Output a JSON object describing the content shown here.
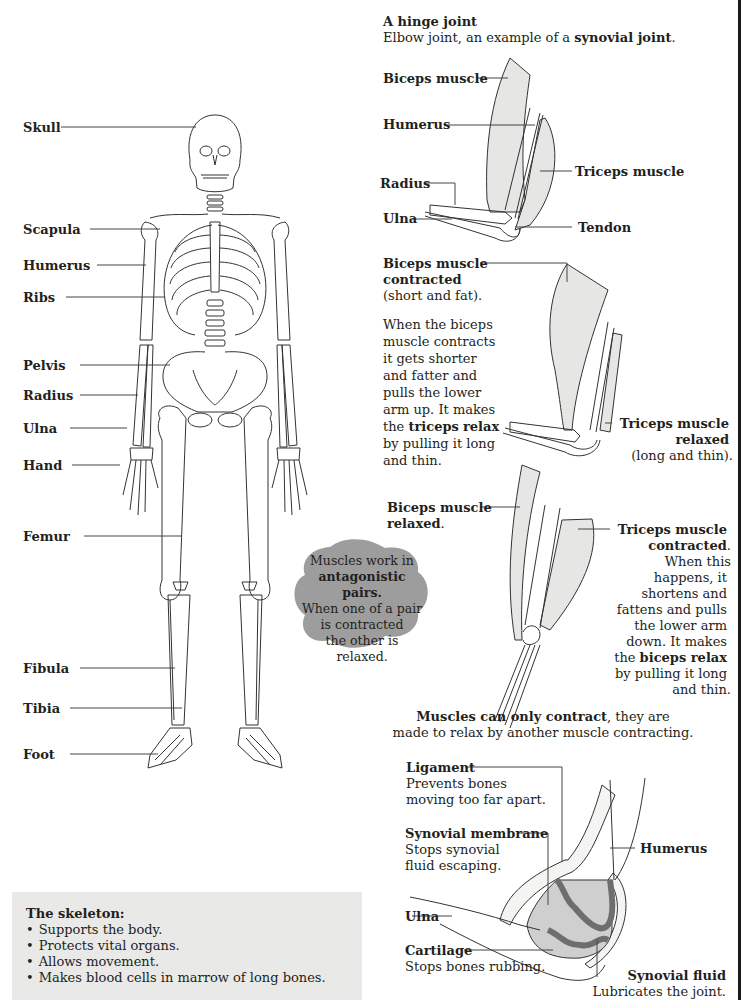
{
  "skeleton": {
    "labels": [
      {
        "id": "skull",
        "text": "Skull"
      },
      {
        "id": "scapula",
        "text": "Scapula"
      },
      {
        "id": "humerus",
        "text": "Humerus"
      },
      {
        "id": "ribs",
        "text": "Ribs"
      },
      {
        "id": "pelvis",
        "text": "Pelvis"
      },
      {
        "id": "radius",
        "text": "Radius"
      },
      {
        "id": "ulna",
        "text": "Ulna"
      },
      {
        "id": "hand",
        "text": "Hand"
      },
      {
        "id": "femur",
        "text": "Femur"
      },
      {
        "id": "fibula",
        "text": "Fibula"
      },
      {
        "id": "tibia",
        "text": "Tibia"
      },
      {
        "id": "foot",
        "text": "Foot"
      }
    ],
    "infobox": {
      "title": "The skeleton:",
      "items": [
        "Supports the body.",
        "Protects vital organs.",
        "Allows movement.",
        "Makes blood cells in marrow of long bones."
      ]
    }
  },
  "hinge": {
    "title": "A hinge joint",
    "subtitle_pre": "Elbow joint, an example of a ",
    "subtitle_bold": "synovial joint",
    "subtitle_post": ".",
    "labels": {
      "biceps": "Biceps muscle",
      "humerus": "Humerus",
      "triceps": "Triceps muscle",
      "radius": "Radius",
      "ulna": "Ulna",
      "tendon": "Tendon"
    }
  },
  "contracted": {
    "biceps_label_1": "Biceps muscle",
    "biceps_label_2": "contracted",
    "biceps_note": "(short and fat).",
    "para_1": "When the biceps muscle contracts it gets shorter and fatter and pulls the lower arm up. It makes the ",
    "para_bold_1": "triceps",
    "para_bold_2": "relax",
    "para_2": " by pulling it long and thin.",
    "triceps_label_1": "Triceps muscle",
    "triceps_label_2": "relaxed",
    "triceps_note": "(long and thin)."
  },
  "relaxed": {
    "biceps_label_1": "Biceps muscle",
    "biceps_label_2": "relaxed",
    "biceps_label_post": ".",
    "triceps_label_1": "Triceps muscle",
    "triceps_label_2": "contracted",
    "triceps_label_post": ".",
    "lines": [
      "When this",
      "happens, it",
      "shortens and",
      "fattens and pulls",
      "the lower arm",
      "down. It makes"
    ],
    "line_bold": "biceps relax",
    "line_bold_pre": "the ",
    "tail_lines": [
      "by pulling it long",
      "and thin."
    ]
  },
  "cloud": {
    "line_1": "Muscles work in",
    "line_2_bold": "antagonistic pairs.",
    "line_3": "When one of a pair",
    "line_4": "is contracted",
    "line_5": "the other is",
    "line_6": "relaxed.",
    "color": "#9d9d9d"
  },
  "contract_note": {
    "bold": "Muscles can only contract",
    "rest_1": ", they are",
    "line_2": "made to relax by another muscle contracting."
  },
  "synovial": {
    "ligament_title": "Ligament",
    "ligament_desc_1": "Prevents bones",
    "ligament_desc_2": "moving too far apart.",
    "membrane_title": "Synovial membrane",
    "membrane_desc_1": "Stops synovial",
    "membrane_desc_2": "fluid escaping.",
    "humerus": "Humerus",
    "ulna": "Ulna",
    "cartilage_title": "Cartilage",
    "cartilage_desc": "Stops bones rubbing.",
    "fluid_title": "Synovial fluid",
    "fluid_desc": "Lubricates the joint."
  },
  "colors": {
    "muscle_fill": "#e6e6e4",
    "cartilage": "#8a8a8a",
    "fluid": "#cfcfcf",
    "infobox_bg": "#e9e9e7"
  }
}
